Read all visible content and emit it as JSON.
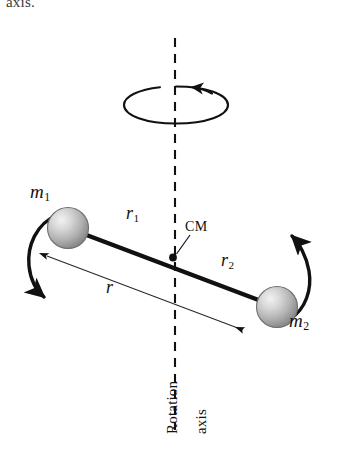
{
  "figure": {
    "title_fragment": "axis.",
    "background_color": "#ffffff",
    "ink_color": "#111111",
    "sphere_fill_light": "#e2e2e2",
    "sphere_fill_dark": "#8d8d8d",
    "labels": {
      "mass1": "m",
      "mass1_sub": "1",
      "mass2": "m",
      "mass2_sub": "2",
      "radius1": "r",
      "radius1_sub": "1",
      "radius2": "r",
      "radius2_sub": "2",
      "radius_total": "r",
      "center_of_mass": "CM",
      "axis_line1": "Rotation",
      "axis_line2": "axis"
    },
    "icons": {
      "rotation_arrow": "rotation-ellipse-arrow",
      "dashed_axis": "dashed-vertical-axis",
      "cm_point": "center-of-mass-dot",
      "rod": "rigid-rod",
      "swing_arrow_left": "curved-arrow-mass1",
      "swing_arrow_right": "curved-arrow-mass2",
      "r_measure": "double-headed-measure-arrow"
    }
  }
}
